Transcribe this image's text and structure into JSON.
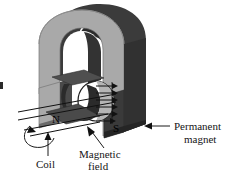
{
  "figure": {
    "labels": {
      "permanent_magnet_line1": "Permanent",
      "permanent_magnet_line2": "magnet",
      "coil": "Coil",
      "magnetic_field_line1": "Magnetic",
      "magnetic_field_line2": "field",
      "pole_north": "N",
      "pole_south": "S"
    },
    "colors": {
      "magnet_front_face": "#a9a9a9",
      "magnet_dark_face": "#3a3a3a",
      "magnet_inner_shadow": "#2b2b2b",
      "magnet_edge": "#6e6e6e",
      "coil_dark": "#2e2e2e",
      "coil_mid": "#555555",
      "plate_gray": "#4c4c4c",
      "background": "#ffffff",
      "line": "#111111",
      "text": "#151515"
    },
    "arrows": {
      "field_arrow_count": 6,
      "field_direction": "north-to-south",
      "rotation_arrow": "counter-clockwise"
    }
  }
}
